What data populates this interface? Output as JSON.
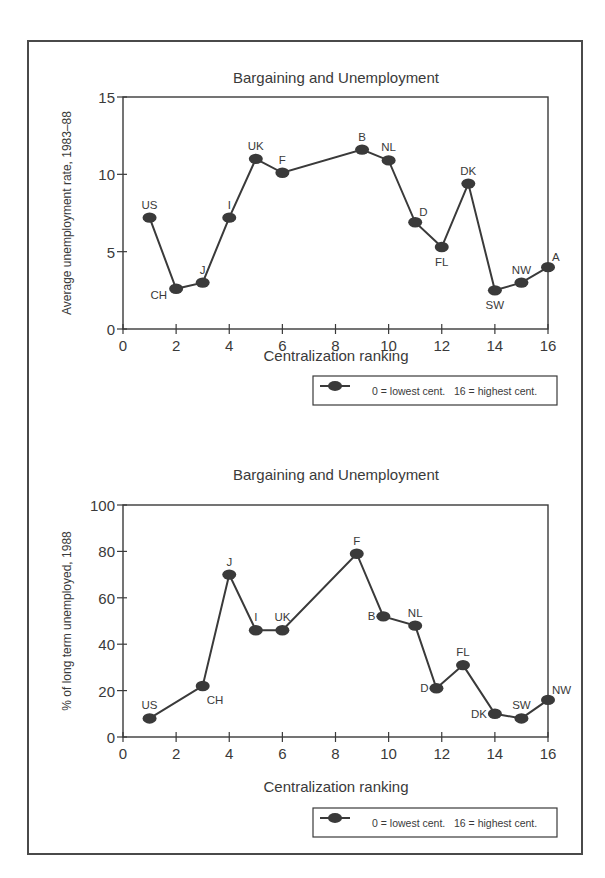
{
  "chart_data": [
    {
      "type": "line",
      "title": "Bargaining and Unemployment",
      "xlabel": "Centralization ranking",
      "ylabel": "Average unemployment rate, 1983–88",
      "xlim": [
        0,
        16
      ],
      "ylim": [
        0,
        15
      ],
      "xticks": [
        "0",
        "2",
        "4",
        "6",
        "8",
        "10",
        "12",
        "14",
        "16"
      ],
      "yticks": [
        "0",
        "5",
        "10",
        "15"
      ],
      "grid": false,
      "legend": {
        "position": "below-right",
        "entries": [
          "0 = lowest cent.   16 = highest cent."
        ]
      },
      "series": [
        {
          "name": "Countries",
          "points": [
            {
              "label": "US",
              "x": 1,
              "y": 7.2,
              "label_pos": "above"
            },
            {
              "label": "CH",
              "x": 2,
              "y": 2.6,
              "label_pos": "below-left"
            },
            {
              "label": "J",
              "x": 3,
              "y": 3.0,
              "label_pos": "above"
            },
            {
              "label": "I",
              "x": 4,
              "y": 7.2,
              "label_pos": "above"
            },
            {
              "label": "UK",
              "x": 5,
              "y": 11.0,
              "label_pos": "above"
            },
            {
              "label": "F",
              "x": 6,
              "y": 10.1,
              "label_pos": "above"
            },
            {
              "label": "B",
              "x": 9,
              "y": 11.6,
              "label_pos": "above"
            },
            {
              "label": "NL",
              "x": 10,
              "y": 10.9,
              "label_pos": "above"
            },
            {
              "label": "D",
              "x": 11,
              "y": 6.9,
              "label_pos": "above-right"
            },
            {
              "label": "FL",
              "x": 12,
              "y": 5.3,
              "label_pos": "below"
            },
            {
              "label": "DK",
              "x": 13,
              "y": 9.4,
              "label_pos": "above"
            },
            {
              "label": "SW",
              "x": 14,
              "y": 2.5,
              "label_pos": "below"
            },
            {
              "label": "NW",
              "x": 15,
              "y": 3.0,
              "label_pos": "above"
            },
            {
              "label": "A",
              "x": 16,
              "y": 4.0,
              "label_pos": "above-right"
            }
          ]
        }
      ]
    },
    {
      "type": "line",
      "title": "Bargaining and Unemployment",
      "xlabel": "Centralization ranking",
      "ylabel": "% of long term unemployed, 1988",
      "xlim": [
        0,
        16
      ],
      "ylim": [
        0,
        100
      ],
      "xticks": [
        "0",
        "2",
        "4",
        "6",
        "8",
        "10",
        "12",
        "14",
        "16"
      ],
      "yticks": [
        "0",
        "20",
        "40",
        "60",
        "80",
        "100"
      ],
      "grid": false,
      "legend": {
        "position": "below-right",
        "entries": [
          "0 = lowest cent.   16 = highest cent."
        ]
      },
      "series": [
        {
          "name": "Countries",
          "points": [
            {
              "label": "US",
              "x": 1,
              "y": 8,
              "label_pos": "above"
            },
            {
              "label": "CH",
              "x": 3,
              "y": 22,
              "label_pos": "below-right"
            },
            {
              "label": "J",
              "x": 4,
              "y": 70,
              "label_pos": "above"
            },
            {
              "label": "I",
              "x": 5,
              "y": 46,
              "label_pos": "above"
            },
            {
              "label": "UK",
              "x": 6,
              "y": 46,
              "label_pos": "above"
            },
            {
              "label": "F",
              "x": 8.8,
              "y": 79,
              "label_pos": "above"
            },
            {
              "label": "B",
              "x": 9.8,
              "y": 52,
              "label_pos": "left"
            },
            {
              "label": "NL",
              "x": 11,
              "y": 48,
              "label_pos": "above"
            },
            {
              "label": "D",
              "x": 11.8,
              "y": 21,
              "label_pos": "left"
            },
            {
              "label": "FL",
              "x": 12.8,
              "y": 31,
              "label_pos": "above"
            },
            {
              "label": "DK",
              "x": 14,
              "y": 10,
              "label_pos": "left"
            },
            {
              "label": "SW",
              "x": 15,
              "y": 8,
              "label_pos": "above"
            },
            {
              "label": "NW",
              "x": 16,
              "y": 16,
              "label_pos": "above-right"
            }
          ]
        }
      ]
    }
  ],
  "style": {
    "line_color": "#3a3a3a",
    "marker_color": "#3a3a3a",
    "axis_color": "#3a3a3a",
    "frame_color": "#4a4a4a"
  }
}
